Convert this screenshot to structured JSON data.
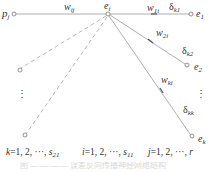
{
  "diagram": {
    "nodes": {
      "p_j": {
        "label": "p",
        "sub": "j"
      },
      "e_i": {
        "label": "e",
        "sub": "i"
      },
      "e_1": {
        "label": "e",
        "sub": "1"
      },
      "e_2": {
        "label": "e",
        "sub": "2"
      },
      "e_k": {
        "label": "e",
        "sub": "k"
      }
    },
    "edges": {
      "w_ij": {
        "label": "w",
        "sub": "ij"
      },
      "w_1i": {
        "label": "w",
        "sub": "1i"
      },
      "w_2i": {
        "label": "w",
        "sub": "2i"
      },
      "w_ki": {
        "label": "w",
        "sub": "ki"
      },
      "delta_k1": {
        "label": "δ",
        "sub": "k1"
      },
      "delta_k2": {
        "label": "δ",
        "sub": "k2"
      },
      "delta_kk": {
        "label": "δ",
        "sub": "kk"
      }
    },
    "ellipsis": "⋮",
    "ranges": [
      {
        "var": "k",
        "text": "=1, 2, ···, ",
        "end": "s",
        "end_sub": "21"
      },
      {
        "var": "i",
        "text": "=1, 2, ···, ",
        "end": "s",
        "end_sub": "11"
      },
      {
        "var": "j",
        "text": "=1, 2, ···, ",
        "end": "r",
        "end_sub": ""
      }
    ],
    "caption": "图 — — — — 误差反向传播神经网络结构"
  },
  "colors": {
    "solid_line": "#9a9a9a",
    "dashed_line": "#b0b0b0",
    "node_stroke": "#777777",
    "text": "#333333"
  }
}
